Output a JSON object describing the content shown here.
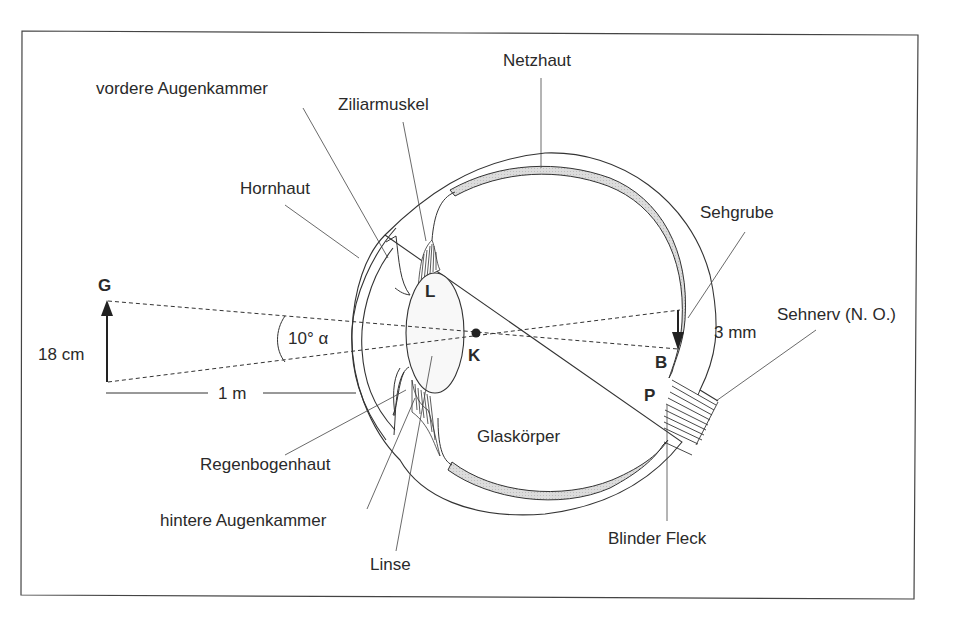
{
  "diagram": {
    "type": "eye-cross-section",
    "frame": {
      "stroke": "#444444"
    },
    "colors": {
      "line": "#333333",
      "retina_fill": "#d6d6d6",
      "background": "#ffffff"
    },
    "labels": {
      "vordere_augenkammer": "vordere Augenkammer",
      "ziliarmuskel": "Ziliarmuskel",
      "netzhaut": "Netzhaut",
      "hornhaut": "Hornhaut",
      "sehgrube": "Sehgrube",
      "sehnerv": "Sehnerv (N. O.)",
      "regenbogenhaut": "Regenbogenhaut",
      "hintere_augenkammer": "hintere Augenkammer",
      "linse": "Linse",
      "glaskoerper": "Glaskörper",
      "blinder_fleck": "Blinder Fleck"
    },
    "points": {
      "G": "G",
      "L": "L",
      "K": "K",
      "B": "B",
      "P": "P"
    },
    "measurements": {
      "object_height": "18 cm",
      "distance": "1 m",
      "angle": "10° α",
      "image_height": "3 mm"
    }
  }
}
